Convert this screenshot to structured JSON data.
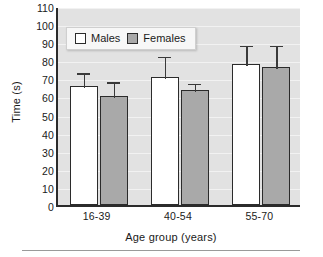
{
  "chart_data": {
    "type": "bar",
    "title": "",
    "xlabel": "Age group (years)",
    "ylabel": "Time (s)",
    "categories": [
      "16-39",
      "40-54",
      "55-70"
    ],
    "ylim": [
      0,
      110
    ],
    "yticks": [
      0,
      10,
      20,
      30,
      40,
      50,
      60,
      70,
      80,
      90,
      100,
      110
    ],
    "grid": true,
    "legend_position": "top-left-inside",
    "series": [
      {
        "name": "Males",
        "color": "#ffffff",
        "values": [
          66,
          71,
          78
        ],
        "error_upper": [
          74,
          83,
          89
        ]
      },
      {
        "name": "Females",
        "color": "#a9a9a9",
        "values": [
          60,
          63.5,
          76.5
        ],
        "error_upper": [
          69,
          68,
          89
        ]
      }
    ]
  },
  "axis": {
    "y_tick_labels": [
      "0",
      "10",
      "20",
      "30",
      "40",
      "50",
      "60",
      "70",
      "80",
      "90",
      "100",
      "110"
    ],
    "x_tick_labels": [
      "16-39",
      "40-54",
      "55-70"
    ]
  },
  "legend": {
    "items": [
      {
        "label": "Males",
        "swatch": "white-square-icon"
      },
      {
        "label": "Females",
        "swatch": "gray-square-icon"
      }
    ]
  }
}
